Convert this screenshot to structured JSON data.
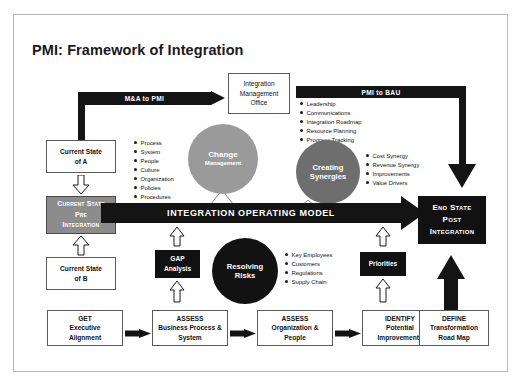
{
  "page": {
    "title": "PMI: Framework of Integration"
  },
  "colors": {
    "black": "#141414",
    "dark_box": "#111111",
    "gray_box": "#8c8c8c",
    "circle_change": "#9a9a9a",
    "circle_synergies": "#6e6e6e",
    "circle_risks": "#121212",
    "frame_border": "#b9b9b9",
    "page_background": "#ffffff"
  },
  "flows": {
    "ma_to_pmi": "M&A to PMI",
    "pmi_to_bau": "PMI to BAU",
    "integration_operating_model": "INTEGRATION OPERATING MODEL"
  },
  "nodes": {
    "imo": {
      "line1": "Integration",
      "line2": "Management",
      "line3": "Office"
    },
    "current_state_a": {
      "line1": "Current State",
      "line2": "of A"
    },
    "current_state_b": {
      "line1": "Current State",
      "line2": "of B"
    },
    "current_state_pre": {
      "line1": "Current State",
      "line2": "Pre",
      "line3": "Integration"
    },
    "end_state_post": {
      "line1": "End State",
      "line2": "Post",
      "line3": "Integration"
    },
    "gap_analysis": {
      "line1": "GAP",
      "line2": "Analysis"
    },
    "priorities": {
      "line1": "Priorities"
    },
    "change_management": {
      "line1": "Change",
      "line2": "Management"
    },
    "creating_synergies": {
      "line1": "Creating",
      "line2": "Synergies"
    },
    "resolving_risks": {
      "line1": "Resolving",
      "line2": "Risks"
    }
  },
  "bullets": {
    "change_management": [
      "Process",
      "System",
      "People",
      "Culture",
      "Organization",
      "Policies",
      "Procedures"
    ],
    "pmi_to_bau": [
      "Leadership",
      "Communications",
      "Integration Roadmap",
      "Resource Planning",
      "Progress Tracking"
    ],
    "synergies": [
      "Cost Synergy",
      "Revenue Synergy",
      "Improvements",
      "Value Drivers"
    ],
    "risks": [
      "Key Employees",
      "Customers",
      "Regulations",
      "Supply Chain"
    ]
  },
  "process_steps": [
    {
      "verb": "GET",
      "line1": "Executive",
      "line2": "Alignment"
    },
    {
      "verb": "ASSESS",
      "line1": "Business Process &",
      "line2": "System"
    },
    {
      "verb": "ASSESS",
      "line1": "Organization &",
      "line2": "People"
    },
    {
      "verb": "IDENTIFY",
      "line1": "Potential",
      "line2": "Improvements"
    },
    {
      "verb": "DEFINE",
      "line1": "Transformation",
      "line2": "Road Map"
    }
  ]
}
